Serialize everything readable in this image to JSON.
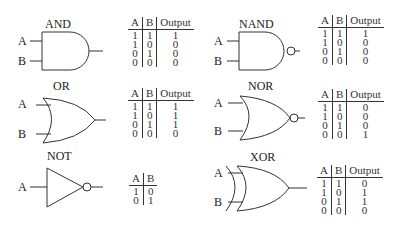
{
  "gates": [
    {
      "name": "AND",
      "inputs": [
        "A",
        "B"
      ],
      "table": {
        "headers": [
          "A",
          "B",
          "Output"
        ],
        "rows": [
          [
            "1",
            "1",
            "1"
          ],
          [
            "1",
            "0",
            "0"
          ],
          [
            "0",
            "1",
            "0"
          ],
          [
            "0",
            "0",
            "0"
          ]
        ]
      }
    },
    {
      "name": "NAND",
      "inputs": [
        "A",
        "B"
      ],
      "table": {
        "headers": [
          "A",
          "B",
          "Output"
        ],
        "rows": [
          [
            "1",
            "1",
            "1"
          ],
          [
            "1",
            "0",
            "0"
          ],
          [
            "0",
            "1",
            "0"
          ],
          [
            "0",
            "0",
            "0"
          ]
        ]
      }
    },
    {
      "name": "OR",
      "inputs": [
        "A",
        "B"
      ],
      "table": {
        "headers": [
          "A",
          "B",
          "Output"
        ],
        "rows": [
          [
            "1",
            "1",
            "1"
          ],
          [
            "1",
            "0",
            "1"
          ],
          [
            "0",
            "1",
            "1"
          ],
          [
            "0",
            "0",
            "0"
          ]
        ]
      }
    },
    {
      "name": "NOR",
      "inputs": [
        "A",
        "B"
      ],
      "table": {
        "headers": [
          "A",
          "B",
          "Output"
        ],
        "rows": [
          [
            "1",
            "1",
            "0"
          ],
          [
            "1",
            "0",
            "0"
          ],
          [
            "0",
            "1",
            "0"
          ],
          [
            "0",
            "0",
            "1"
          ]
        ]
      }
    },
    {
      "name": "NOT",
      "inputs": [
        "A"
      ],
      "table": {
        "headers": [
          "A",
          "B"
        ],
        "rows": [
          [
            "1",
            "0"
          ],
          [
            "0",
            "1"
          ]
        ]
      }
    },
    {
      "name": "XOR",
      "inputs": [
        "A",
        "B"
      ],
      "table": {
        "headers": [
          "A",
          "B",
          "Output"
        ],
        "rows": [
          [
            "1",
            "1",
            "0"
          ],
          [
            "1",
            "0",
            "1"
          ],
          [
            "0",
            "1",
            "1"
          ],
          [
            "0",
            "0",
            "0"
          ]
        ]
      }
    }
  ]
}
